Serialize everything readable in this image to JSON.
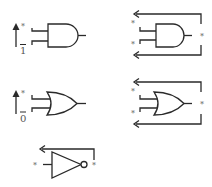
{
  "diagram": {
    "title": "",
    "colors": {
      "line": "#2a2a2a",
      "label": "#555555",
      "background": "#ffffff"
    },
    "panels": [
      {
        "id": "and-constant",
        "gate": "AND",
        "labels": {
          "input_marker": "*",
          "constant": "1"
        },
        "constant_overbar": true,
        "arrow": "up"
      },
      {
        "id": "and-feedback",
        "gate": "AND",
        "labels": {
          "input_top": "*",
          "input_bottom": "*",
          "output": "*"
        },
        "feedback": [
          "top",
          "bottom"
        ]
      },
      {
        "id": "or-constant",
        "gate": "OR",
        "labels": {
          "input_marker": "*",
          "constant": "0"
        },
        "constant_overbar": true,
        "arrow": "up"
      },
      {
        "id": "or-feedback",
        "gate": "OR",
        "labels": {
          "input_top": "*",
          "input_bottom": "*",
          "output": "*"
        },
        "feedback": [
          "top",
          "bottom"
        ]
      },
      {
        "id": "not-feedback",
        "gate": "NOT",
        "labels": {
          "input": "*",
          "output": "*"
        },
        "feedback": [
          "top"
        ]
      }
    ]
  }
}
